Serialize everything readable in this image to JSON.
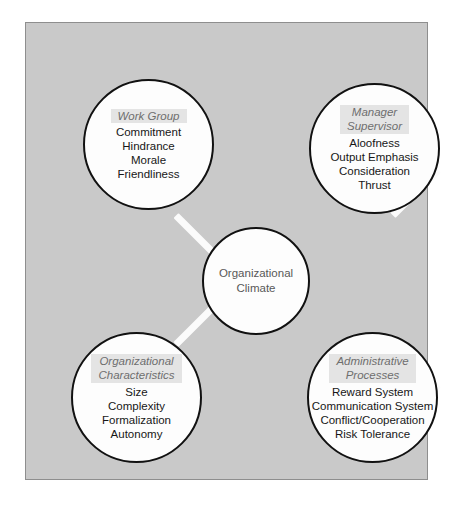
{
  "diagram": {
    "center": {
      "label_line1": "Organizational",
      "label_line2": "Climate"
    },
    "nodes": [
      {
        "id": "work-group",
        "title_line1": "Work Group",
        "title_line2": "",
        "items": [
          "Commitment",
          "Hindrance",
          "Morale",
          "Friendliness"
        ]
      },
      {
        "id": "manager-supervisor",
        "title_line1": "Manager",
        "title_line2": "Supervisor",
        "items": [
          "Aloofness",
          "Output Emphasis",
          "Consideration",
          "Thrust"
        ]
      },
      {
        "id": "organizational-characteristics",
        "title_line1": "Organizational",
        "title_line2": "Characteristics",
        "items": [
          "Size",
          "Complexity",
          "Formalization",
          "Autonomy"
        ]
      },
      {
        "id": "administrative-processes",
        "title_line1": "Administrative",
        "title_line2": "Processes",
        "items": [
          "Reward System",
          "Communication System",
          "Conflict/Cooperation",
          "Risk Tolerance"
        ]
      }
    ],
    "colors": {
      "panel_background": "#c9c9c9",
      "panel_border": "#8e8e8e",
      "circle_fill": "#fdfdfd",
      "circle_stroke": "#111111",
      "connector": "#fbfbfb",
      "title_text": "#6e6e6e",
      "title_highlight": "#e4e4e4",
      "item_text": "#171717",
      "center_text": "#585858"
    }
  }
}
